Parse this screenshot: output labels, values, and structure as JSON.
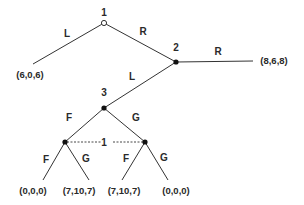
{
  "diagram": {
    "type": "extensive-form game tree",
    "nodes": {
      "n1": {
        "player": "1",
        "kind": "root"
      },
      "n2": {
        "player": "2"
      },
      "n3": {
        "player": "3"
      },
      "n1a": {
        "player": "1",
        "info_set": "1"
      },
      "n1b": {
        "player": "1",
        "info_set": "1"
      }
    },
    "node_labels": {
      "n1": "1",
      "n2": "2",
      "n3": "3",
      "info_set": "1"
    },
    "edge_labels": {
      "n1_left": "L",
      "n1_right": "R",
      "n2_left": "L",
      "n2_right": "R",
      "n3_left": "F",
      "n3_right": "G",
      "n1a_left": "F",
      "n1a_right": "G",
      "n1b_left": "F",
      "n1b_right": "G"
    },
    "payoffs": {
      "n1_L": "(6,0,6)",
      "n2_R": "(8,6,8)",
      "FF": "(0,0,0)",
      "FG": "(7,10,7)",
      "GF": "(7,10,7)",
      "GG": "(0,0,0)"
    }
  }
}
